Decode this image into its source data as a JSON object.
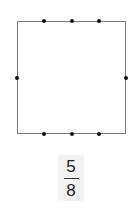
{
  "diagram": {
    "shape": "square",
    "border_color": "#7a7a7a",
    "dot_color": "#111111",
    "dots": [
      {
        "side": "top",
        "x": 44,
        "y": 21
      },
      {
        "side": "top",
        "x": 72,
        "y": 21
      },
      {
        "side": "top",
        "x": 99,
        "y": 21
      },
      {
        "side": "left",
        "x": 17,
        "y": 78
      },
      {
        "side": "right",
        "x": 126,
        "y": 78
      },
      {
        "side": "bottom",
        "x": 44,
        "y": 134
      },
      {
        "side": "bottom",
        "x": 72,
        "y": 134
      },
      {
        "side": "bottom",
        "x": 99,
        "y": 134
      }
    ]
  },
  "fraction": {
    "numerator": "5",
    "denominator": "8",
    "background": "#f2f2f2"
  }
}
